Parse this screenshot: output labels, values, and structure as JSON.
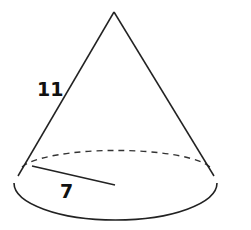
{
  "figure": {
    "shape": "cone",
    "slant_height_label": "11",
    "radius_label": "7",
    "colors": {
      "stroke": "#222222",
      "background": "#ffffff"
    }
  }
}
